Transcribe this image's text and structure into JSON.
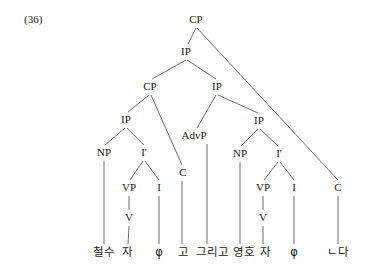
{
  "figure": {
    "example_number": "(36)",
    "type": "syntax-tree"
  },
  "tree": {
    "nodes": [
      {
        "id": "cp-root",
        "label": "CP",
        "x": 196,
        "y": 20
      },
      {
        "id": "ip-1",
        "label": "IP",
        "x": 186,
        "y": 52
      },
      {
        "id": "cp-2",
        "label": "CP",
        "x": 150,
        "y": 87
      },
      {
        "id": "ip-2",
        "label": "IP",
        "x": 217,
        "y": 87
      },
      {
        "id": "ip-3",
        "label": "IP",
        "x": 126,
        "y": 120
      },
      {
        "id": "advp",
        "label": "AdvP",
        "x": 194,
        "y": 136
      },
      {
        "id": "ip-4",
        "label": "IP",
        "x": 259,
        "y": 121
      },
      {
        "id": "np-1",
        "label": "NP",
        "x": 104,
        "y": 153
      },
      {
        "id": "ibar-1",
        "label": "I'",
        "x": 144,
        "y": 153
      },
      {
        "id": "np-2",
        "label": "NP",
        "x": 240,
        "y": 154
      },
      {
        "id": "ibar-2",
        "label": "I'",
        "x": 279,
        "y": 154
      },
      {
        "id": "c-1",
        "label": "C",
        "x": 183,
        "y": 173
      },
      {
        "id": "vp-1",
        "label": "VP",
        "x": 129,
        "y": 188
      },
      {
        "id": "i-1",
        "label": "I",
        "x": 159,
        "y": 188
      },
      {
        "id": "vp-2",
        "label": "VP",
        "x": 263,
        "y": 188
      },
      {
        "id": "i-2",
        "label": "I",
        "x": 294,
        "y": 188
      },
      {
        "id": "c-2",
        "label": "C",
        "x": 338,
        "y": 188
      },
      {
        "id": "v-1",
        "label": "V",
        "x": 129,
        "y": 218
      },
      {
        "id": "v-2",
        "label": "V",
        "x": 263,
        "y": 218
      }
    ],
    "terminals": [
      {
        "id": "t-cheolsu",
        "label": "철수",
        "x": 104,
        "y": 253
      },
      {
        "id": "t-ja-1",
        "label": "자",
        "x": 127,
        "y": 253
      },
      {
        "id": "t-phi-1",
        "label": "φ",
        "x": 159,
        "y": 253
      },
      {
        "id": "t-go",
        "label": "고",
        "x": 183,
        "y": 253
      },
      {
        "id": "t-geurigo",
        "label": "그리고",
        "x": 212,
        "y": 253
      },
      {
        "id": "t-yeongho",
        "label": "영호",
        "x": 244,
        "y": 253
      },
      {
        "id": "t-ja-2",
        "label": "자",
        "x": 265,
        "y": 253
      },
      {
        "id": "t-phi-2",
        "label": "φ",
        "x": 294,
        "y": 253
      },
      {
        "id": "t-nda",
        "label": "ㄴ다",
        "x": 338,
        "y": 253
      }
    ],
    "edges": [
      {
        "id": "e-cp-ip1",
        "from": "cp-root",
        "to": "ip-1",
        "x1": 196,
        "y1": 28,
        "x2": 188,
        "y2": 44
      },
      {
        "id": "e-cp-c2",
        "from": "cp-root",
        "to": "c-2",
        "x1": 197,
        "y1": 28,
        "x2": 338,
        "y2": 180
      },
      {
        "id": "e-ip1-cp2",
        "from": "ip-1",
        "to": "cp-2",
        "x1": 186,
        "y1": 60,
        "x2": 152,
        "y2": 79
      },
      {
        "id": "e-ip1-ip2",
        "from": "ip-1",
        "to": "ip-2",
        "x1": 187,
        "y1": 60,
        "x2": 216,
        "y2": 79
      },
      {
        "id": "e-cp2-ip3",
        "from": "cp-2",
        "to": "ip-3",
        "x1": 149,
        "y1": 95,
        "x2": 128,
        "y2": 112
      },
      {
        "id": "e-cp2-c1",
        "from": "cp-2",
        "to": "c-1",
        "x1": 151,
        "y1": 95,
        "x2": 182,
        "y2": 165
      },
      {
        "id": "e-ip2-advp",
        "from": "ip-2",
        "to": "advp",
        "x1": 216,
        "y1": 95,
        "x2": 197,
        "y2": 128
      },
      {
        "id": "e-ip2-ip4",
        "from": "ip-2",
        "to": "ip-4",
        "x1": 218,
        "y1": 95,
        "x2": 258,
        "y2": 113
      },
      {
        "id": "e-ip3-np1",
        "from": "ip-3",
        "to": "np-1",
        "x1": 125,
        "y1": 128,
        "x2": 105,
        "y2": 145
      },
      {
        "id": "e-ip3-ibar1",
        "from": "ip-3",
        "to": "ibar-1",
        "x1": 127,
        "y1": 128,
        "x2": 144,
        "y2": 145
      },
      {
        "id": "e-ip4-np2",
        "from": "ip-4",
        "to": "np-2",
        "x1": 258,
        "y1": 129,
        "x2": 241,
        "y2": 146
      },
      {
        "id": "e-ip4-ibar2",
        "from": "ip-4",
        "to": "ibar-2",
        "x1": 260,
        "y1": 129,
        "x2": 278,
        "y2": 146
      },
      {
        "id": "e-ibar1-vp1",
        "from": "ibar-1",
        "to": "vp-1",
        "x1": 143,
        "y1": 161,
        "x2": 130,
        "y2": 180
      },
      {
        "id": "e-ibar1-i1",
        "from": "ibar-1",
        "to": "i-1",
        "x1": 145,
        "y1": 161,
        "x2": 159,
        "y2": 180
      },
      {
        "id": "e-ibar2-vp2",
        "from": "ibar-2",
        "to": "vp-2",
        "x1": 278,
        "y1": 162,
        "x2": 264,
        "y2": 180
      },
      {
        "id": "e-ibar2-i2",
        "from": "ibar-2",
        "to": "i-2",
        "x1": 280,
        "y1": 162,
        "x2": 294,
        "y2": 180
      },
      {
        "id": "e-vp1-v1",
        "from": "vp-1",
        "to": "v-1",
        "x1": 129,
        "y1": 196,
        "x2": 129,
        "y2": 210
      },
      {
        "id": "e-vp2-v2",
        "from": "vp-2",
        "to": "v-2",
        "x1": 263,
        "y1": 196,
        "x2": 263,
        "y2": 210
      },
      {
        "id": "e-np1-t",
        "from": "np-1",
        "to": "t-cheolsu",
        "x1": 104,
        "y1": 161,
        "x2": 104,
        "y2": 244
      },
      {
        "id": "e-v1-t",
        "from": "v-1",
        "to": "t-ja-1",
        "x1": 129,
        "y1": 226,
        "x2": 128,
        "y2": 244
      },
      {
        "id": "e-i1-t",
        "from": "i-1",
        "to": "t-phi-1",
        "x1": 159,
        "y1": 196,
        "x2": 159,
        "y2": 244
      },
      {
        "id": "e-c1-t",
        "from": "c-1",
        "to": "t-go",
        "x1": 182,
        "y1": 181,
        "x2": 182,
        "y2": 244
      },
      {
        "id": "e-advp-t",
        "from": "advp",
        "to": "t-geurigo",
        "x1": 207,
        "y1": 144,
        "x2": 207,
        "y2": 244
      },
      {
        "id": "e-np2-t",
        "from": "np-2",
        "to": "t-yeongho",
        "x1": 240,
        "y1": 162,
        "x2": 240,
        "y2": 244
      },
      {
        "id": "e-v2-t",
        "from": "v-2",
        "to": "t-ja-2",
        "x1": 263,
        "y1": 226,
        "x2": 263,
        "y2": 244
      },
      {
        "id": "e-i2-t",
        "from": "i-2",
        "to": "t-phi-2",
        "x1": 294,
        "y1": 196,
        "x2": 294,
        "y2": 244
      },
      {
        "id": "e-c2-t",
        "from": "c-2",
        "to": "t-nda",
        "x1": 338,
        "y1": 196,
        "x2": 338,
        "y2": 244
      }
    ]
  },
  "colors": {
    "background": "#ffffff",
    "line": "#5f5f5f",
    "text": "#1c1c1c"
  }
}
